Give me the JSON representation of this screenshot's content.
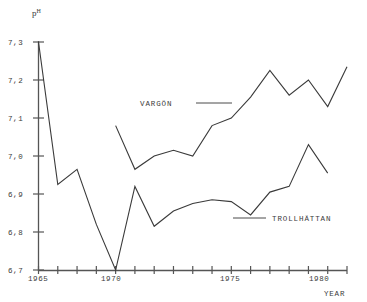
{
  "chart_data": {
    "type": "line",
    "title": "",
    "xlabel": "YEAR",
    "ylabel": "pH",
    "ylabel_base": "p",
    "ylabel_sup": "H",
    "xlim": [
      1965,
      1981
    ],
    "ylim": [
      6.7,
      7.3
    ],
    "grid": false,
    "legend_position": "inline-annotation",
    "y_ticks": [
      "7,3",
      "7,2",
      "7,1",
      "7,0",
      "6,9",
      "6,8",
      "6,7"
    ],
    "y_tick_values": [
      7.3,
      7.2,
      7.1,
      7.0,
      6.9,
      6.8,
      6.7
    ],
    "x_ticks_labeled": [
      "1965",
      "1970",
      "1975",
      "1980"
    ],
    "x_tick_values": [
      1965,
      1966,
      1967,
      1968,
      1969,
      1970,
      1971,
      1972,
      1973,
      1974,
      1975,
      1976,
      1977,
      1978,
      1979,
      1980,
      1981
    ],
    "series": [
      {
        "name": "VARGÖN",
        "x": [
          1969,
          1970,
          1971,
          1972,
          1973,
          1974,
          1975,
          1976,
          1977,
          1978,
          1979,
          1980,
          1981
        ],
        "values": [
          7.08,
          6.965,
          7.0,
          7.015,
          7.0,
          7.08,
          7.1,
          7.155,
          7.225,
          7.16,
          7.2,
          7.13,
          7.235
        ]
      },
      {
        "name": "TROLLHÄTTAN",
        "x": [
          1965,
          1966,
          1967,
          1968,
          1969,
          1970,
          1971,
          1972,
          1973,
          1974,
          1975,
          1976,
          1977,
          1978,
          1979,
          1980
        ],
        "values": [
          7.3,
          6.925,
          6.965,
          6.82,
          6.7,
          6.92,
          6.815,
          6.855,
          6.875,
          6.885,
          6.88,
          6.845,
          6.905,
          6.92,
          7.03,
          6.955
        ]
      }
    ],
    "annotations": [
      {
        "label": "VARGÖN",
        "leader": true
      },
      {
        "label": "TROLLHÄTTAN",
        "leader": true
      }
    ]
  },
  "axis": {
    "y_title_base": "p",
    "y_title_sup": "H",
    "x_title": "YEAR"
  }
}
